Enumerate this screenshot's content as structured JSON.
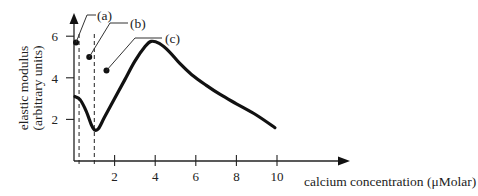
{
  "chart_data": {
    "type": "line",
    "title": "",
    "xlabel": "calcium concentration (μMolar)",
    "ylabel_lines": [
      "elastic modulus",
      "(arbitrary units)"
    ],
    "x_ticks": [
      2,
      4,
      6,
      8,
      10
    ],
    "x_tick_labels": [
      "2",
      "4",
      "6",
      "8",
      "10"
    ],
    "y_ticks": [
      2,
      4,
      6
    ],
    "y_tick_labels": [
      "2",
      "4",
      "6"
    ],
    "xlim": [
      0,
      13.6
    ],
    "ylim": [
      0,
      7
    ],
    "grid": false,
    "legend": null,
    "series": [
      {
        "name": "elastic modulus",
        "x": [
          0.05,
          0.3,
          0.6,
          0.85,
          1.0,
          1.2,
          1.5,
          2.0,
          2.5,
          3.0,
          3.5,
          3.8,
          4.2,
          4.7,
          5.2,
          5.8,
          6.5,
          7.2,
          8.0,
          9.0,
          9.9
        ],
        "y": [
          3.1,
          2.95,
          2.4,
          1.75,
          1.5,
          1.55,
          2.1,
          3.0,
          3.9,
          4.8,
          5.5,
          5.75,
          5.65,
          5.25,
          4.7,
          4.15,
          3.65,
          3.2,
          2.75,
          2.2,
          1.6
        ]
      }
    ],
    "reference_lines": [
      {
        "type": "vertical",
        "x": 0.25,
        "style": "dashed"
      },
      {
        "type": "vertical",
        "x": 1.0,
        "style": "dashed"
      }
    ],
    "annotations": [
      {
        "label": "(a)",
        "point": [
          0.1,
          5.7
        ]
      },
      {
        "label": "(b)",
        "point": [
          0.75,
          5.0
        ]
      },
      {
        "label": "(c)",
        "point": [
          1.6,
          4.35
        ]
      }
    ]
  }
}
